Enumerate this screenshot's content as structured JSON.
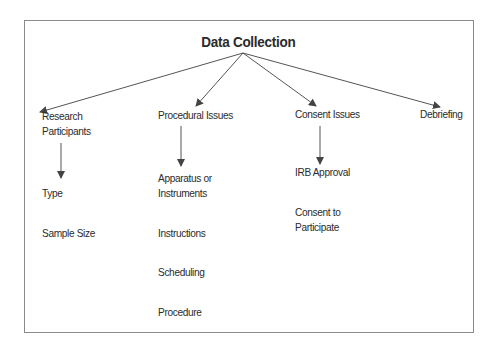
{
  "diagram": {
    "title": "Data Collection",
    "branches": [
      {
        "label_lines": [
          "Research",
          "Participants"
        ],
        "items": [
          {
            "lines": [
              "Type"
            ]
          },
          {
            "lines": [
              "Sample Size"
            ]
          }
        ]
      },
      {
        "label_lines": [
          "Procedural Issues"
        ],
        "items": [
          {
            "lines": [
              "Apparatus or",
              "Instruments"
            ]
          },
          {
            "lines": [
              "Instructions"
            ]
          },
          {
            "lines": [
              "Scheduling"
            ]
          },
          {
            "lines": [
              "Procedure"
            ]
          }
        ]
      },
      {
        "label_lines": [
          "Consent Issues"
        ],
        "items": [
          {
            "lines": [
              "IRB Approval"
            ]
          },
          {
            "lines": [
              "Consent to",
              "Participate"
            ]
          }
        ]
      },
      {
        "label_lines": [
          "Debriefing"
        ],
        "items": []
      }
    ],
    "colors": {
      "line": "#555555",
      "border": "#8a8a8a",
      "text": "#2b2b2b"
    }
  }
}
